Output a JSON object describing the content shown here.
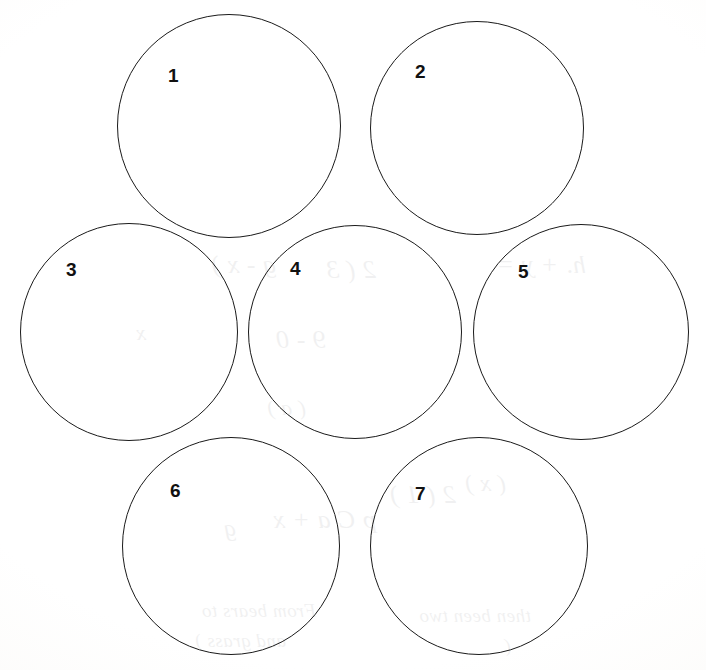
{
  "page": {
    "width": 706,
    "height": 670,
    "background_color": "#fdfdfc",
    "ink_color": "#1a1a1a",
    "label_color": "#111111"
  },
  "circles": [
    {
      "label": "1",
      "cx": 229,
      "cy": 126,
      "r": 112,
      "label_x": 168,
      "label_y": 66
    },
    {
      "label": "2",
      "cx": 477,
      "cy": 128,
      "r": 107,
      "label_x": 415,
      "label_y": 62
    },
    {
      "label": "3",
      "cx": 129,
      "cy": 332,
      "r": 109,
      "label_x": 66,
      "label_y": 260
    },
    {
      "label": "4",
      "cx": 355,
      "cy": 332,
      "r": 107,
      "label_x": 290,
      "label_y": 259
    },
    {
      "label": "5",
      "cx": 581,
      "cy": 332,
      "r": 108,
      "label_x": 518,
      "label_y": 262
    },
    {
      "label": "6",
      "cx": 231,
      "cy": 546,
      "r": 109,
      "label_x": 170,
      "label_y": 481
    },
    {
      "label": "7",
      "cx": 479,
      "cy": 546,
      "r": 109,
      "label_x": 415,
      "label_y": 484
    }
  ],
  "bleedthrough": {
    "note": "Faint mirrored handwriting showing through from the reverse side of the sheet",
    "lines": [
      {
        "text": "h. + y =",
        "x": 120,
        "y": 250,
        "size": 26
      },
      {
        "text": "2 ( 3",
        "x": 330,
        "y": 255,
        "size": 26
      },
      {
        "text": "g - x )",
        "x": 430,
        "y": 250,
        "size": 26
      },
      {
        "text": "9 - 0",
        "x": 380,
        "y": 325,
        "size": 26
      },
      {
        "text": "x",
        "x": 560,
        "y": 320,
        "size": 22
      },
      {
        "text": "( a )",
        "x": 400,
        "y": 395,
        "size": 22
      },
      {
        "text": "( x )",
        "x": 200,
        "y": 470,
        "size": 24
      },
      {
        "text": "2 ( 1 )",
        "x": 250,
        "y": 480,
        "size": 26
      },
      {
        "text": "p C a + x",
        "x": 330,
        "y": 505,
        "size": 26
      },
      {
        "text": "g",
        "x": 470,
        "y": 515,
        "size": 24
      },
      {
        "text": "then been two",
        "x": 175,
        "y": 605,
        "size": 19
      },
      {
        "text": "From bears to",
        "x": 390,
        "y": 600,
        "size": 19
      },
      {
        "text": "and grass )",
        "x": 420,
        "y": 630,
        "size": 19
      },
      {
        "text": "(",
        "x": 195,
        "y": 635,
        "size": 19
      }
    ]
  }
}
